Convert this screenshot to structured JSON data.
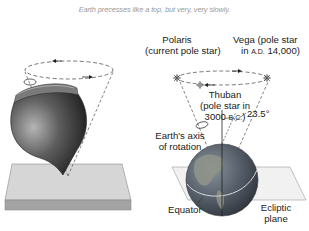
{
  "caption": "Earth precesses like a top, but very, very slowly.",
  "labels": {
    "polaris_line1": "Polaris",
    "polaris_line2": "(current pole star)",
    "vega_line1": "Vega (pole star",
    "vega_line2_prefix": "in ",
    "vega_line2_era": "A.D.",
    "vega_line2_suffix": " 14,000)",
    "thuban_line1": "Thuban",
    "thuban_line2": "(pole star in",
    "thuban_line3_prefix": "3000 ",
    "thuban_line3_era": "B.C.",
    "thuban_line3_suffix": ")",
    "axis_line1": "Earth's axis",
    "axis_line2": "of rotation",
    "tilt_angle": "23.5°",
    "equator": "Equator",
    "ecliptic_line1": "Ecliptic",
    "ecliptic_line2": "plane"
  },
  "colors": {
    "caption": "#9a9a9a",
    "label": "#222222",
    "top_body": "#4a4a4a",
    "plane_top": "#d9d9d9",
    "plane_side": "#9e9e9e",
    "ocean": "#5b6470",
    "land": "#8a8f86"
  }
}
